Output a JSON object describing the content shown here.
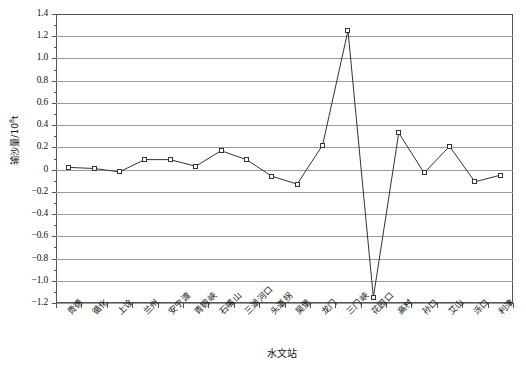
{
  "chart_data": {
    "type": "line",
    "title": "",
    "xlabel": "水文站",
    "ylabel": "输沙量/10⁸t",
    "ylabel_base": "输沙量/10",
    "ylabel_exp": "8",
    "ylabel_unit": "t",
    "categories": [
      "贵德",
      "循化",
      "上诠",
      "兰州",
      "安宁渡",
      "青铜峡",
      "石嘴山",
      "三湖河口",
      "头道拐",
      "吴堡",
      "龙门",
      "三门峡",
      "花园口",
      "高村",
      "孙口",
      "艾山",
      "泺口",
      "利津"
    ],
    "values": [
      0.02,
      0.01,
      -0.02,
      0.09,
      0.09,
      0.03,
      0.17,
      0.09,
      -0.06,
      -0.13,
      0.22,
      1.25,
      -1.15,
      0.33,
      -0.03,
      0.21,
      -0.11,
      -0.05
    ],
    "series": [
      {
        "name": "输沙量",
        "values": [
          0.02,
          0.01,
          -0.02,
          0.09,
          0.09,
          0.03,
          0.17,
          0.09,
          -0.06,
          -0.13,
          0.22,
          1.25,
          -1.15,
          0.33,
          -0.03,
          0.21,
          -0.11,
          -0.05
        ]
      }
    ],
    "ylim": [
      -1.2,
      1.4
    ],
    "ytick_labels": [
      "1.4",
      "1.2",
      "1.0",
      "0.8",
      "0.6",
      "0.4",
      "0.2",
      "0",
      "−0.2",
      "−0.4",
      "−0.6",
      "−0.8",
      "−1.0",
      "−1.2"
    ],
    "ytick_values": [
      1.4,
      1.2,
      1.0,
      0.8,
      0.6,
      0.4,
      0.2,
      0,
      -0.2,
      -0.4,
      -0.6,
      -0.8,
      -1.0,
      -1.2
    ],
    "grid": true,
    "legend": "none",
    "marker": "open-square",
    "line_color": "#333333"
  },
  "colors": {
    "line": "#333333",
    "grid": "#9a9a9a",
    "axis": "#555555",
    "text": "#111111",
    "background": "#ffffff"
  }
}
